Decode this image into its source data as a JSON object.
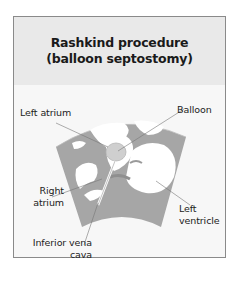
{
  "figure": {
    "title_line1": "Rashkind procedure",
    "title_line2": "(balloon septostomy)",
    "colors": {
      "border": "#8a8a8a",
      "header_bg": "#e9e9e9",
      "body_bg": "#f7f7f7",
      "tissue_gray": "#a6a6a6",
      "chamber_white": "#ffffff",
      "balloon_fill": "#cfcfcf",
      "leader_line": "#777777"
    },
    "labels": {
      "left_atrium": "Left atrium",
      "balloon": "Balloon",
      "right_atrium_line1": "Right",
      "right_atrium_line2": "atrium",
      "left_ventricle_line1": "Left",
      "left_ventricle_line2": "ventricle",
      "ivc_line1": "Inferior vena",
      "ivc_line2": "cava"
    }
  }
}
